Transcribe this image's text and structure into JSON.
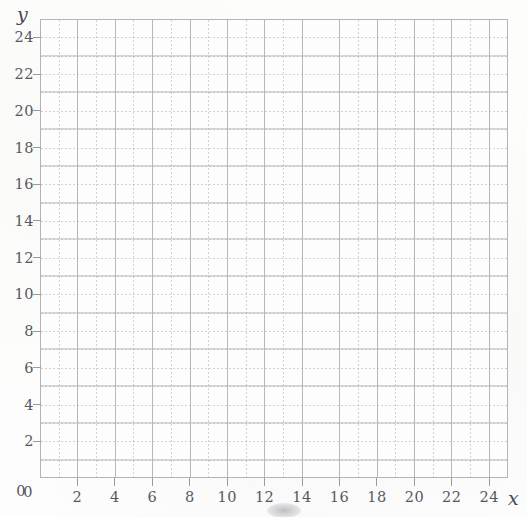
{
  "page": {
    "background_color": "#fdfdfc",
    "width": 527,
    "height": 517,
    "top_cut_text": "",
    "smudge_label": "scan-smudge"
  },
  "axes": {
    "x_name": "x",
    "y_name": "y"
  },
  "chart_data": {
    "type": "scatter",
    "title": "",
    "subtitle": "",
    "xlabel": "x",
    "ylabel": "y",
    "xlim": [
      0,
      25
    ],
    "ylim": [
      0,
      25
    ],
    "x_ticks": [
      0,
      2,
      4,
      6,
      8,
      10,
      12,
      14,
      16,
      18,
      20,
      22,
      24
    ],
    "y_ticks": [
      0,
      2,
      4,
      6,
      8,
      10,
      12,
      14,
      16,
      18,
      20,
      22,
      24
    ],
    "x_tick_labels": [
      "0",
      "2",
      "4",
      "6",
      "8",
      "10",
      "12",
      "14",
      "16",
      "18",
      "20",
      "22",
      "24"
    ],
    "y_tick_labels": [
      "0",
      "2",
      "4",
      "6",
      "8",
      "10",
      "12",
      "14",
      "16",
      "18",
      "20",
      "22",
      "24"
    ],
    "minor_tick_step": 1,
    "major_tick_step": 2,
    "grid": true,
    "grid_minor": true,
    "grid_major": true,
    "legend": false,
    "legend_position": "none",
    "series": [],
    "values": [],
    "annotations": [],
    "note": "Empty coordinate grid - no data plotted"
  },
  "colors": {
    "grid_minor": "#9b9ba5",
    "grid_major": "#b0b0b8",
    "frame_border": "#b4b4b4",
    "tick_mark": "#9a9a9a",
    "tick_label_text": "#585860",
    "axis_name_text": "#4a4a52",
    "plot_background": "#fdfdfd"
  }
}
